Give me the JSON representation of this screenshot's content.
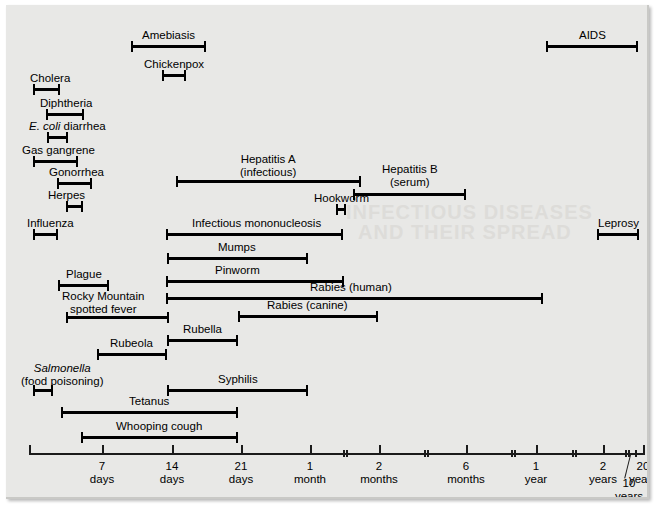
{
  "figure": {
    "background_color": "#e8e8e6",
    "bar_color": "#000000"
  },
  "ghost_text": [
    "INFECTIOUS DISEASES",
    "AND THEIR SPREAD"
  ],
  "chart_data": {
    "type": "bar",
    "orientation": "horizontal-range",
    "xlabel": "",
    "ylabel": "",
    "grid": false,
    "legend": "none",
    "x_axis": {
      "scale": "nonlinear-time",
      "ticks": [
        {
          "label_top": "7",
          "label_bottom": "days",
          "x": 96,
          "kind": "major"
        },
        {
          "label_top": "14",
          "label_bottom": "days",
          "x": 166,
          "kind": "major"
        },
        {
          "label_top": "21",
          "label_bottom": "days",
          "x": 235,
          "kind": "major"
        },
        {
          "label_top": "1",
          "label_bottom": "month",
          "x": 304,
          "kind": "major"
        },
        {
          "label_top": "",
          "label_bottom": "",
          "x": 337,
          "kind": "double"
        },
        {
          "label_top": "2",
          "label_bottom": "months",
          "x": 373,
          "kind": "major"
        },
        {
          "label_top": "",
          "label_bottom": "",
          "x": 418,
          "kind": "double"
        },
        {
          "label_top": "6",
          "label_bottom": "months",
          "x": 460,
          "kind": "major"
        },
        {
          "label_top": "",
          "label_bottom": "",
          "x": 505,
          "kind": "double"
        },
        {
          "label_top": "1",
          "label_bottom": "year",
          "x": 530,
          "kind": "major"
        },
        {
          "label_top": "",
          "label_bottom": "",
          "x": 566,
          "kind": "double"
        },
        {
          "label_top": "2",
          "label_bottom": "years",
          "x": 597,
          "kind": "major"
        },
        {
          "label_top": "",
          "label_bottom": "",
          "x": 619,
          "kind": "double"
        },
        {
          "label_top": "10",
          "label_bottom": "years",
          "x": 629,
          "kind": "leader"
        },
        {
          "label_top": "20",
          "label_bottom": "years",
          "x": 637,
          "kind": "major"
        }
      ],
      "axis_start_x": 23,
      "axis_end_x": 639
    },
    "bars": [
      {
        "name": "Amebiasis",
        "label": "Amebiasis",
        "x1": 125,
        "x2": 200,
        "y": 40,
        "label_y": 24,
        "label_cx": 162,
        "lines": 1
      },
      {
        "name": "AIDS",
        "label": "AIDS",
        "x1": 540,
        "x2": 632,
        "y": 40,
        "label_y": 24,
        "label_cx": 586,
        "lines": 1
      },
      {
        "name": "Chickenpox",
        "label": "Chickenpox",
        "x1": 156,
        "x2": 180,
        "y": 69,
        "label_y": 53,
        "label_cx": 168,
        "lines": 1
      },
      {
        "name": "Cholera",
        "label": "Cholera",
        "x1": 27,
        "x2": 54,
        "y": 83,
        "label_y": 67,
        "label_cx": 44,
        "lines": 1
      },
      {
        "name": "Diphtheria",
        "label": "Diphtheria",
        "x1": 40,
        "x2": 78,
        "y": 108,
        "label_y": 92,
        "label_cx": 60,
        "lines": 1
      },
      {
        "name": "E. coli diarrhea",
        "label": "E. coli diarrhea",
        "x1": 41,
        "x2": 62,
        "y": 131,
        "label_y": 115,
        "label_cx": 61,
        "lines": 1,
        "italic_prefix": "E. coli",
        "rest": " diarrhea"
      },
      {
        "name": "Gas gangrene",
        "label": "Gas gangrene",
        "x1": 27,
        "x2": 72,
        "y": 155,
        "label_y": 139,
        "label_cx": 52,
        "lines": 1
      },
      {
        "name": "Gonorrhea",
        "label": "Gonorrhea",
        "x1": 51,
        "x2": 86,
        "y": 177,
        "label_y": 161,
        "label_cx": 70,
        "lines": 1
      },
      {
        "name": "Hepatitis A (infectious)",
        "label": "Hepatitis A\n(infectious)",
        "x1": 170,
        "x2": 355,
        "y": 175,
        "label_y": 148,
        "label_cx": 262,
        "lines": 2
      },
      {
        "name": "Hepatitis B (serum)",
        "label": "Hepatitis B\n(serum)",
        "x1": 347,
        "x2": 460,
        "y": 188,
        "label_y": 158,
        "label_cx": 404,
        "lines": 2
      },
      {
        "name": "Herpes",
        "label": "Herpes",
        "x1": 60,
        "x2": 77,
        "y": 200,
        "label_y": 184,
        "label_cx": 60,
        "lines": 1
      },
      {
        "name": "Hookworm",
        "label": "Hookworm",
        "x1": 330,
        "x2": 340,
        "y": 203,
        "label_y": 187,
        "label_cx": 335,
        "lines": 1
      },
      {
        "name": "Infectious mononucleosis",
        "label": "Infectious mononucleosis",
        "x1": 160,
        "x2": 337,
        "y": 228,
        "label_y": 212,
        "label_cx": 250,
        "lines": 1
      },
      {
        "name": "Influenza",
        "label": "Influenza",
        "x1": 27,
        "x2": 52,
        "y": 228,
        "label_y": 212,
        "label_cx": 44,
        "lines": 1
      },
      {
        "name": "Leprosy",
        "label": "Leprosy",
        "x1": 591,
        "x2": 633,
        "y": 228,
        "label_y": 212,
        "label_cx": 612,
        "lines": 1
      },
      {
        "name": "Mumps",
        "label": "Mumps",
        "x1": 161,
        "x2": 302,
        "y": 252,
        "label_y": 236,
        "label_cx": 231,
        "lines": 1
      },
      {
        "name": "Pinworm",
        "label": "Pinworm",
        "x1": 160,
        "x2": 338,
        "y": 275,
        "label_y": 259,
        "label_cx": 231,
        "lines": 1
      },
      {
        "name": "Plague",
        "label": "Plague",
        "x1": 52,
        "x2": 103,
        "y": 279,
        "label_y": 263,
        "label_cx": 78,
        "lines": 1
      },
      {
        "name": "Rabies (human)",
        "label": "Rabies (human)",
        "x1": 160,
        "x2": 537,
        "y": 292,
        "label_y": 276,
        "label_cx": 345,
        "lines": 1
      },
      {
        "name": "Rabies (canine)",
        "label": "Rabies (canine)",
        "x1": 232,
        "x2": 372,
        "y": 310,
        "label_y": 294,
        "label_cx": 301,
        "lines": 1
      },
      {
        "name": "Rocky Mountain spotted fever",
        "label": "Rocky Mountain\nspotted fever",
        "x1": 60,
        "x2": 163,
        "y": 311,
        "label_y": 285,
        "label_cx": 97,
        "lines": 2
      },
      {
        "name": "Rubella",
        "label": "Rubella",
        "x1": 161,
        "x2": 232,
        "y": 334,
        "label_y": 318,
        "label_cx": 196,
        "lines": 1
      },
      {
        "name": "Rubeola",
        "label": "Rubeola",
        "x1": 91,
        "x2": 161,
        "y": 348,
        "label_y": 332,
        "label_cx": 125,
        "lines": 1
      },
      {
        "name": "Salmonella (food poisoning)",
        "label": "Salmonella\n(food poisoning)",
        "x1": 27,
        "x2": 47,
        "y": 384,
        "label_y": 357,
        "label_cx": 56,
        "lines": 2,
        "italic_prefix": "Salmonella"
      },
      {
        "name": "Syphilis",
        "label": "Syphilis",
        "x1": 161,
        "x2": 302,
        "y": 384,
        "label_y": 368,
        "label_cx": 232,
        "lines": 1
      },
      {
        "name": "Tetanus",
        "label": "Tetanus",
        "x1": 55,
        "x2": 232,
        "y": 406,
        "label_y": 390,
        "label_cx": 143,
        "lines": 1
      },
      {
        "name": "Whooping cough",
        "label": "Whooping cough",
        "x1": 75,
        "x2": 232,
        "y": 431,
        "label_y": 415,
        "label_cx": 153,
        "lines": 1
      }
    ]
  }
}
